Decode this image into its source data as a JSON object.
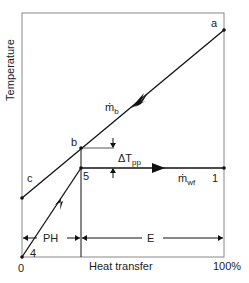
{
  "diagram": {
    "type": "temperature-heat-transfer",
    "y_axis_label": "Temperature",
    "x_axis_label": "Heat transfer",
    "x_min_label": "0",
    "x_max_label": "100%",
    "points": {
      "a": "a",
      "b": "b",
      "c": "c",
      "p1": "1",
      "p4": "4",
      "p5": "5"
    },
    "streams": {
      "hot": {
        "symbol": "ṁ",
        "subscript": "b"
      },
      "cold": {
        "symbol": "ṁ",
        "subscript": "wf"
      }
    },
    "pinch": {
      "delta": "ΔT",
      "subscript": "pp"
    },
    "regions": {
      "preheater": "PH",
      "evaporator": "E"
    },
    "colors": {
      "line": "#111111",
      "frame": "#888888",
      "text": "#222222"
    }
  }
}
